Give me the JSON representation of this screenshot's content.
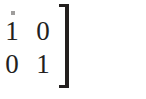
{
  "page": {
    "kind": "scanned-math-fragment",
    "background_color": "#ffffff",
    "ink_color": "#231f1e",
    "width_px": 146,
    "height_px": 99
  },
  "matrix": {
    "label": "identity-matrix-2x2",
    "rows": 2,
    "columns": 2,
    "values": [
      [
        "1",
        "0"
      ],
      [
        "0",
        "1"
      ]
    ],
    "bracket_right": "]",
    "bracket_left_visible": false
  },
  "artifacts": {
    "speck_color": "#8e8c8b"
  }
}
